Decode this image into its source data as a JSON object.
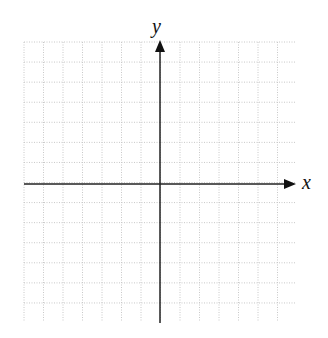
{
  "diagram": {
    "type": "coordinate-plane",
    "x_axis_label": "x",
    "y_axis_label": "y",
    "grid": {
      "left": 24,
      "top": 42,
      "right": 296,
      "bottom": 322,
      "cell_size": 19.5,
      "line_style": "dotted",
      "line_color": "#c8c8c8"
    },
    "origin": {
      "x": 160,
      "y": 184
    },
    "axis_color": "#222222"
  }
}
